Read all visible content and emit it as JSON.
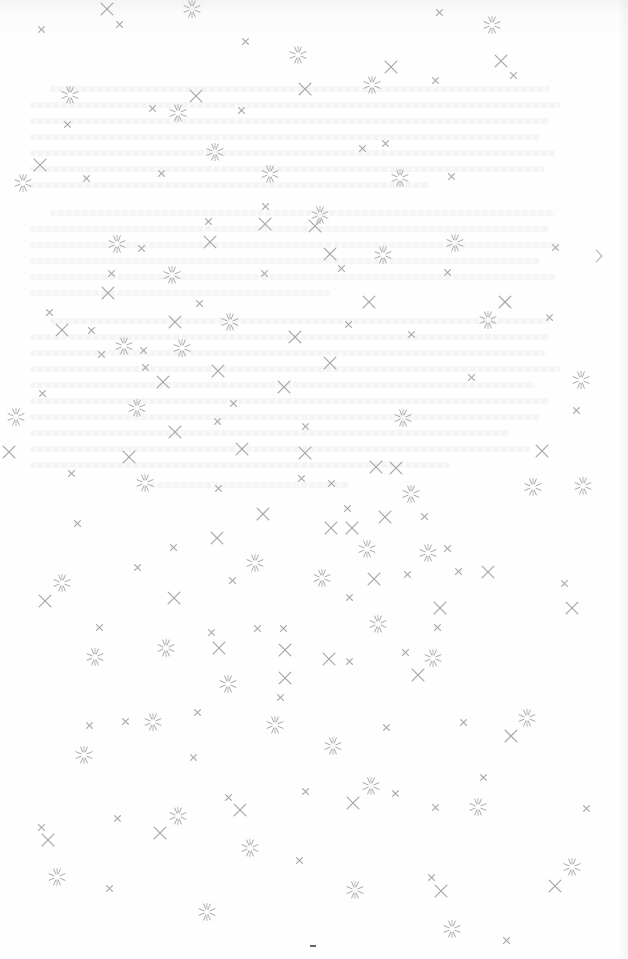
{
  "page": {
    "type": "scanned-decorative-page",
    "background_color": "#fdfdfd",
    "ornament_color": "#a8a8a8",
    "bleed_through_text": "illegible"
  },
  "ornaments": {
    "cross_small": [
      [
        41,
        29
      ],
      [
        119,
        24
      ],
      [
        245,
        41
      ],
      [
        439,
        12
      ],
      [
        513,
        75
      ],
      [
        67,
        124
      ],
      [
        152,
        108
      ],
      [
        241,
        110
      ],
      [
        362,
        148
      ],
      [
        435,
        80
      ],
      [
        86,
        178
      ],
      [
        161,
        173
      ],
      [
        208,
        221
      ],
      [
        265,
        206
      ],
      [
        385,
        143
      ],
      [
        451,
        176
      ],
      [
        141,
        248
      ],
      [
        264,
        273
      ],
      [
        341,
        268
      ],
      [
        447,
        272
      ],
      [
        555,
        247
      ],
      [
        111,
        273
      ],
      [
        49,
        312
      ],
      [
        91,
        330
      ],
      [
        101,
        354
      ],
      [
        143,
        350
      ],
      [
        199,
        303
      ],
      [
        348,
        324
      ],
      [
        411,
        334
      ],
      [
        471,
        377
      ],
      [
        549,
        317
      ],
      [
        42,
        393
      ],
      [
        145,
        367
      ],
      [
        233,
        403
      ],
      [
        305,
        426
      ],
      [
        217,
        421
      ],
      [
        576,
        410
      ],
      [
        71,
        473
      ],
      [
        218,
        488
      ],
      [
        301,
        478
      ],
      [
        331,
        483
      ],
      [
        347,
        508
      ],
      [
        424,
        516
      ],
      [
        77,
        523
      ],
      [
        173,
        547
      ],
      [
        137,
        567
      ],
      [
        232,
        580
      ],
      [
        407,
        574
      ],
      [
        447,
        548
      ],
      [
        458,
        571
      ],
      [
        564,
        583
      ],
      [
        349,
        597
      ],
      [
        99,
        627
      ],
      [
        211,
        632
      ],
      [
        257,
        628
      ],
      [
        283,
        628
      ],
      [
        437,
        627
      ],
      [
        349,
        661
      ],
      [
        405,
        652
      ],
      [
        280,
        697
      ],
      [
        197,
        712
      ],
      [
        89,
        725
      ],
      [
        125,
        721
      ],
      [
        463,
        722
      ],
      [
        386,
        727
      ],
      [
        193,
        757
      ],
      [
        483,
        777
      ],
      [
        228,
        797
      ],
      [
        305,
        791
      ],
      [
        395,
        793
      ],
      [
        435,
        807
      ],
      [
        41,
        827
      ],
      [
        117,
        818
      ],
      [
        586,
        808
      ],
      [
        299,
        860
      ],
      [
        109,
        888
      ],
      [
        431,
        877
      ],
      [
        506,
        940
      ]
    ],
    "cross_large": [
      [
        107,
        9
      ],
      [
        391,
        67
      ],
      [
        501,
        61
      ],
      [
        305,
        89
      ],
      [
        196,
        96
      ],
      [
        40,
        165
      ],
      [
        265,
        224
      ],
      [
        210,
        242
      ],
      [
        315,
        226
      ],
      [
        330,
        254
      ],
      [
        369,
        302
      ],
      [
        505,
        302
      ],
      [
        62,
        330
      ],
      [
        175,
        322
      ],
      [
        295,
        337
      ],
      [
        108,
        293
      ],
      [
        218,
        371
      ],
      [
        163,
        382
      ],
      [
        284,
        387
      ],
      [
        330,
        363
      ],
      [
        175,
        432
      ],
      [
        129,
        457
      ],
      [
        242,
        449
      ],
      [
        305,
        453
      ],
      [
        9,
        452
      ],
      [
        376,
        467
      ],
      [
        396,
        468
      ],
      [
        542,
        451
      ],
      [
        385,
        517
      ],
      [
        331,
        528
      ],
      [
        352,
        528
      ],
      [
        263,
        514
      ],
      [
        217,
        538
      ],
      [
        488,
        572
      ],
      [
        374,
        579
      ],
      [
        45,
        601
      ],
      [
        174,
        598
      ],
      [
        440,
        608
      ],
      [
        572,
        608
      ],
      [
        219,
        648
      ],
      [
        285,
        650
      ],
      [
        329,
        659
      ],
      [
        418,
        675
      ],
      [
        285,
        678
      ],
      [
        511,
        736
      ],
      [
        240,
        810
      ],
      [
        353,
        803
      ],
      [
        160,
        833
      ],
      [
        48,
        840
      ],
      [
        555,
        886
      ],
      [
        441,
        891
      ]
    ],
    "star": [
      [
        192,
        9
      ],
      [
        492,
        25
      ],
      [
        298,
        55
      ],
      [
        372,
        85
      ],
      [
        70,
        95
      ],
      [
        178,
        113
      ],
      [
        215,
        152
      ],
      [
        270,
        174
      ],
      [
        400,
        178
      ],
      [
        23,
        183
      ],
      [
        320,
        215
      ],
      [
        117,
        244
      ],
      [
        172,
        275
      ],
      [
        383,
        255
      ],
      [
        455,
        243
      ],
      [
        230,
        322
      ],
      [
        488,
        320
      ],
      [
        124,
        346
      ],
      [
        182,
        348
      ],
      [
        581,
        380
      ],
      [
        137,
        408
      ],
      [
        403,
        418
      ],
      [
        16,
        417
      ],
      [
        145,
        483
      ],
      [
        411,
        494
      ],
      [
        533,
        487
      ],
      [
        583,
        486
      ],
      [
        255,
        563
      ],
      [
        367,
        549
      ],
      [
        428,
        553
      ],
      [
        62,
        583
      ],
      [
        322,
        578
      ],
      [
        378,
        624
      ],
      [
        95,
        657
      ],
      [
        166,
        648
      ],
      [
        433,
        658
      ],
      [
        228,
        684
      ],
      [
        153,
        722
      ],
      [
        275,
        725
      ],
      [
        527,
        718
      ],
      [
        84,
        755
      ],
      [
        333,
        746
      ],
      [
        371,
        786
      ],
      [
        478,
        807
      ],
      [
        178,
        816
      ],
      [
        250,
        848
      ],
      [
        57,
        877
      ],
      [
        355,
        890
      ],
      [
        207,
        912
      ],
      [
        572,
        867
      ],
      [
        452,
        929
      ]
    ]
  }
}
